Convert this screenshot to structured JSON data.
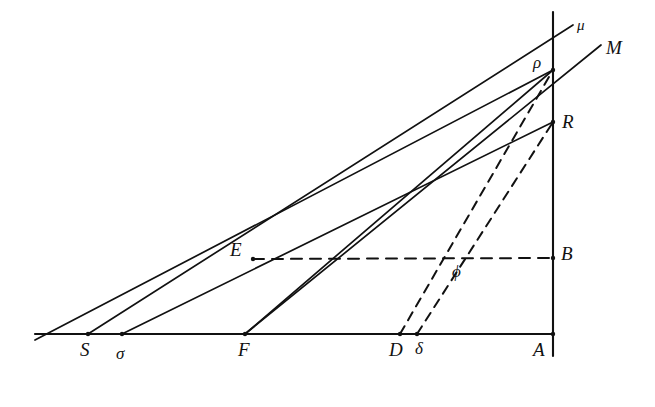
{
  "figure": {
    "background_color": "#ffffff",
    "stroke_color": "#111111",
    "width": 655,
    "height": 407
  },
  "labels": {
    "S": "S",
    "sigma": "σ",
    "F": "F",
    "D": "D",
    "delta": "δ",
    "A": "A",
    "E": "E",
    "B": "B",
    "phi": "ϕ",
    "rho": "ρ",
    "R": "R",
    "mu": "μ",
    "M": "M"
  },
  "points": [
    {
      "name": "S",
      "label": "S",
      "x": 88,
      "y": 334,
      "label_x": 80,
      "label_y": 340,
      "style": "cap"
    },
    {
      "name": "sigma",
      "label": "σ",
      "x": 122,
      "y": 334,
      "label_x": 116,
      "label_y": 345,
      "style": "greek"
    },
    {
      "name": "F",
      "label": "F",
      "x": 245,
      "y": 334,
      "label_x": 238,
      "label_y": 340,
      "style": "cap"
    },
    {
      "name": "D",
      "label": "D",
      "x": 400,
      "y": 334,
      "label_x": 389,
      "label_y": 340,
      "style": "cap"
    },
    {
      "name": "delta",
      "label": "δ",
      "x": 417,
      "y": 334,
      "label_x": 415,
      "label_y": 340,
      "style": "greek"
    },
    {
      "name": "A",
      "label": "A",
      "x": 553,
      "y": 334,
      "label_x": 533,
      "label_y": 340,
      "style": "cap"
    },
    {
      "name": "E",
      "label": "E",
      "x": 253,
      "y": 259,
      "label_x": 230,
      "label_y": 240,
      "style": "cap"
    },
    {
      "name": "B",
      "label": "B",
      "x": 553,
      "y": 258,
      "label_x": 561,
      "label_y": 244,
      "style": "cap"
    },
    {
      "name": "phi",
      "label": "ϕ",
      "x": 455,
      "y": 262,
      "label_x": 452,
      "label_y": 263,
      "style": "greek"
    },
    {
      "name": "rho",
      "label": "ρ",
      "x": 553,
      "y": 70,
      "label_x": 533,
      "label_y": 54,
      "style": "greek"
    },
    {
      "name": "R",
      "label": "R",
      "x": 553,
      "y": 122,
      "label_x": 562,
      "label_y": 112,
      "style": "cap"
    },
    {
      "name": "mu",
      "label": "μ",
      "x": 573,
      "y": 25,
      "label_x": 577,
      "label_y": 18,
      "style": "greek-sm"
    },
    {
      "name": "M",
      "label": "M",
      "x": 601,
      "y": 45,
      "label_x": 606,
      "label_y": 38,
      "style": "cap"
    }
  ],
  "segments": [
    {
      "name": "baseline",
      "kind": "solid",
      "x1": 35,
      "y1": 334,
      "x2": 553,
      "y2": 334,
      "width": 2.1
    },
    {
      "name": "vertical-axis",
      "kind": "solid",
      "x1": 553,
      "y1": 12,
      "x2": 553,
      "y2": 356,
      "width": 2.1
    },
    {
      "name": "S-to-rho-mu",
      "kind": "solid",
      "x1": 88,
      "y1": 334,
      "x2": 573,
      "y2": 25,
      "width": 1.7
    },
    {
      "name": "sigma-to-R",
      "kind": "solid",
      "x1": 122,
      "y1": 334,
      "x2": 553,
      "y2": 122,
      "width": 1.7
    },
    {
      "name": "F-to-rho",
      "kind": "solid",
      "x1": 245,
      "y1": 334,
      "x2": 553,
      "y2": 70,
      "width": 1.7
    },
    {
      "name": "F-to-R-M",
      "kind": "solid",
      "x1": 245,
      "y1": 334,
      "x2": 601,
      "y2": 45,
      "width": 1.7
    },
    {
      "name": "rho-to-E-left",
      "kind": "solid",
      "x1": 553,
      "y1": 70,
      "x2": 35,
      "y2": 340,
      "width": 1.7
    },
    {
      "name": "D-to-rho",
      "kind": "dashed",
      "x1": 400,
      "y1": 334,
      "x2": 553,
      "y2": 70,
      "width": 2.0,
      "dash": "9 7"
    },
    {
      "name": "delta-to-R",
      "kind": "dashed",
      "x1": 417,
      "y1": 334,
      "x2": 553,
      "y2": 122,
      "width": 2.0,
      "dash": "9 7"
    },
    {
      "name": "E-to-B-dashed",
      "kind": "dashed",
      "x1": 253,
      "y1": 259,
      "x2": 553,
      "y2": 258,
      "width": 2.0,
      "dash": "11 8"
    }
  ],
  "vertices_marked": [
    "rho",
    "R",
    "E",
    "F",
    "S",
    "sigma",
    "D",
    "delta",
    "A",
    "B"
  ]
}
